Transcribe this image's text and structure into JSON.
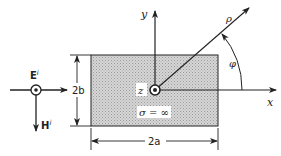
{
  "figure": {
    "axes": {
      "x_label": "x",
      "y_label": "y",
      "z_label": "z"
    },
    "polar": {
      "radius_label": "ρ",
      "angle_label": "φ"
    },
    "conductor": {
      "conductivity_label": "σ = ∞",
      "width_label": "2a",
      "height_label": "2b"
    },
    "incident_wave": {
      "e_field_label": "E",
      "e_field_superscript": "i",
      "h_field_label": "H",
      "h_field_superscript": "i"
    },
    "colors": {
      "line": "#222222",
      "fill": "#c8c8c8",
      "background": "#ffffff"
    }
  }
}
